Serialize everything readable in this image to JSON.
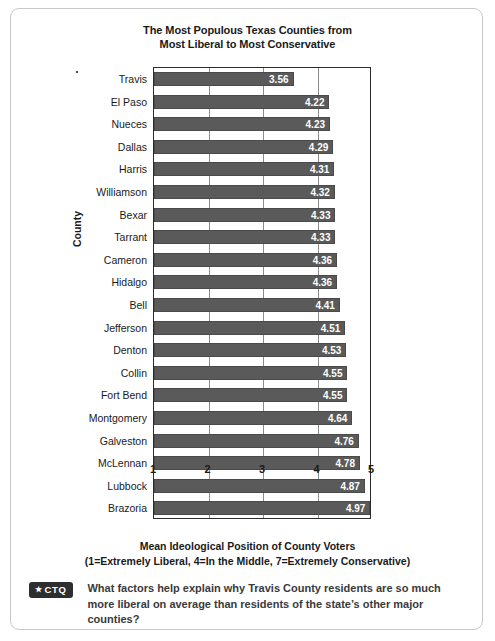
{
  "card": {
    "border_color": "#c9c9c9"
  },
  "chart_data": {
    "type": "bar",
    "orientation": "horizontal",
    "title": "The Most Populous Texas Counties from Most Liberal to Most Conservative",
    "title_line1": "The Most Populous Texas Counties from",
    "title_line2": "Most Liberal to Most Conservative",
    "xlabel": "Mean Ideological Position of County Voters",
    "xlabel_note": "(1=Extremely Liberal, 4=In the Middle, 7=Extremely Conservative)",
    "ylabel": "County",
    "xlim": [
      1,
      5
    ],
    "xticks": [
      1,
      2,
      3,
      4,
      5
    ],
    "xtick_labels": [
      "1",
      "2",
      "3",
      "4",
      "5"
    ],
    "grid": true,
    "legend": "none",
    "bar_color": "#5a5a5a",
    "value_label_color": "#ffffff",
    "categories": [
      "Travis",
      "El Paso",
      "Nueces",
      "Dallas",
      "Harris",
      "Williamson",
      "Bexar",
      "Tarrant",
      "Cameron",
      "Hidalgo",
      "Bell",
      "Jefferson",
      "Denton",
      "Collin",
      "Fort Bend",
      "Montgomery",
      "Galveston",
      "McLennan",
      "Lubbock",
      "Brazoria"
    ],
    "values": [
      3.56,
      4.22,
      4.23,
      4.29,
      4.31,
      4.32,
      4.33,
      4.33,
      4.36,
      4.36,
      4.41,
      4.51,
      4.53,
      4.55,
      4.55,
      4.64,
      4.76,
      4.78,
      4.87,
      4.97
    ],
    "value_labels": [
      "3.56",
      "4.22",
      "4.23",
      "4.29",
      "4.31",
      "4.32",
      "4.33",
      "4.33",
      "4.36",
      "4.36",
      "4.41",
      "4.51",
      "4.53",
      "4.55",
      "4.55",
      "4.64",
      "4.76",
      "4.78",
      "4.87",
      "4.97"
    ]
  },
  "ctq": {
    "badge_star": "★",
    "badge_label": "CTQ",
    "question": "What factors help explain why Travis County residents are so much more liberal on average than residents of the state’s other major counties?"
  }
}
